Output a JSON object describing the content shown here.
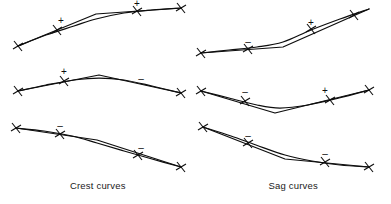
{
  "figure": {
    "title": "",
    "background": "#ffffff",
    "stroke_color": "#0d0d0d",
    "width": 391,
    "height": 204
  },
  "captions": {
    "left": "Crest curves",
    "right": "Sag curves"
  },
  "chart_data": {
    "type": "line",
    "subtitle": "Vertical curve types by approach and departure grade signs",
    "xlabel": "",
    "ylabel": "",
    "grid": false,
    "legend": "none",
    "columns": [
      {
        "name": "Crest curves",
        "caption": "Crest curves"
      },
      {
        "name": "Sag curves",
        "caption": "Sag curves"
      }
    ],
    "panels": [
      {
        "id": "crest-1",
        "column": "Crest curves",
        "row": 1,
        "description": "Positive grade into smaller positive grade",
        "grade_signs": [
          "+",
          "+"
        ],
        "tangent_points": [
          [
            18,
            46
          ],
          [
            96,
            14
          ],
          [
            181,
            8
          ]
        ],
        "smooth_points": [
          [
            18,
            46
          ],
          [
            46,
            35
          ],
          [
            74,
            26
          ],
          [
            96,
            19
          ],
          [
            124,
            13
          ],
          [
            152,
            10
          ],
          [
            181,
            8
          ]
        ],
        "tick_points": [
          [
            18,
            46
          ],
          [
            57,
            30
          ],
          [
            137,
            11
          ],
          [
            181,
            8
          ]
        ],
        "sign_labels": [
          {
            "text": "+",
            "x": 61,
            "y": 21
          },
          {
            "text": "+",
            "x": 137,
            "y": 4
          }
        ]
      },
      {
        "id": "crest-2",
        "column": "Crest curves",
        "row": 2,
        "description": "Positive grade into negative grade",
        "grade_signs": [
          "+",
          "-"
        ],
        "tangent_points": [
          [
            18,
            91
          ],
          [
            99,
            75
          ],
          [
            181,
            93
          ]
        ],
        "smooth_points": [
          [
            18,
            91
          ],
          [
            46,
            85
          ],
          [
            74,
            80
          ],
          [
            99,
            78
          ],
          [
            124,
            80
          ],
          [
            152,
            86
          ],
          [
            181,
            93
          ]
        ],
        "tick_points": [
          [
            18,
            91
          ],
          [
            64,
            81
          ],
          [
            181,
            93
          ]
        ],
        "sign_labels": [
          {
            "text": "+",
            "x": 64,
            "y": 72
          },
          {
            "text": "-",
            "x": 141,
            "y": 79
          }
        ]
      },
      {
        "id": "crest-3",
        "column": "Crest curves",
        "row": 3,
        "description": "Negative grade into steeper negative grade",
        "grade_signs": [
          "-",
          "-"
        ],
        "tangent_points": [
          [
            16,
            128
          ],
          [
            97,
            140
          ],
          [
            181,
            167
          ]
        ],
        "smooth_points": [
          [
            16,
            128
          ],
          [
            44,
            131
          ],
          [
            72,
            136
          ],
          [
            97,
            143
          ],
          [
            124,
            151
          ],
          [
            152,
            159
          ],
          [
            181,
            167
          ]
        ],
        "tick_points": [
          [
            16,
            128
          ],
          [
            60,
            134
          ],
          [
            138,
            155
          ],
          [
            181,
            167
          ]
        ],
        "sign_labels": [
          {
            "text": "-",
            "x": 60,
            "y": 126
          },
          {
            "text": "-",
            "x": 141,
            "y": 148
          }
        ]
      },
      {
        "id": "sag-1",
        "column": "Sag curves",
        "row": 1,
        "description": "Negative grade into positive grade with sag",
        "grade_signs": [
          "-",
          "+"
        ],
        "tangent_points": [
          [
            201,
            53
          ],
          [
            283,
            47
          ],
          [
            369,
            9
          ]
        ],
        "smooth_points": [
          [
            201,
            53
          ],
          [
            229,
            50
          ],
          [
            257,
            47
          ],
          [
            283,
            42
          ],
          [
            311,
            30
          ],
          [
            340,
            19
          ],
          [
            369,
            9
          ]
        ],
        "tick_points": [
          [
            201,
            53
          ],
          [
            248,
            49
          ],
          [
            311,
            29
          ],
          [
            354,
            15
          ]
        ],
        "sign_labels": [
          {
            "text": "-",
            "x": 248,
            "y": 42
          },
          {
            "text": "+",
            "x": 311,
            "y": 23
          }
        ]
      },
      {
        "id": "sag-2",
        "column": "Sag curves",
        "row": 2,
        "description": "Negative grade into positive grade",
        "grade_signs": [
          "-",
          "+"
        ],
        "tangent_points": [
          [
            201,
            91
          ],
          [
            275,
            113
          ],
          [
            369,
            90
          ]
        ],
        "smooth_points": [
          [
            201,
            91
          ],
          [
            229,
            98
          ],
          [
            257,
            105
          ],
          [
            280,
            108
          ],
          [
            308,
            105
          ],
          [
            339,
            98
          ],
          [
            369,
            90
          ]
        ],
        "tick_points": [
          [
            201,
            91
          ],
          [
            245,
            101
          ],
          [
            330,
            100
          ],
          [
            369,
            90
          ]
        ],
        "sign_labels": [
          {
            "text": "-",
            "x": 245,
            "y": 92
          },
          {
            "text": "+",
            "x": 325,
            "y": 91
          }
        ]
      },
      {
        "id": "sag-3",
        "column": "Sag curves",
        "row": 3,
        "description": "Negative grade into flatter negative grade",
        "grade_signs": [
          "-",
          "-"
        ],
        "tangent_points": [
          [
            203,
            127
          ],
          [
            285,
            159
          ],
          [
            369,
            167
          ]
        ],
        "smooth_points": [
          [
            203,
            127
          ],
          [
            231,
            136
          ],
          [
            256,
            145
          ],
          [
            285,
            155
          ],
          [
            312,
            161
          ],
          [
            340,
            165
          ],
          [
            369,
            167
          ]
        ],
        "tick_points": [
          [
            203,
            127
          ],
          [
            248,
            143
          ],
          [
            325,
            162
          ],
          [
            369,
            167
          ]
        ],
        "sign_labels": [
          {
            "text": "-",
            "x": 248,
            "y": 136
          },
          {
            "text": "-",
            "x": 325,
            "y": 154
          }
        ]
      }
    ]
  }
}
